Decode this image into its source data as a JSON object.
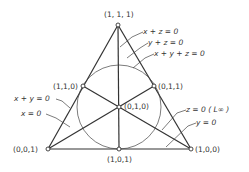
{
  "figure": {
    "points": [
      {
        "id": "top",
        "label": "(1, 1, 1)"
      },
      {
        "id": "left-mid",
        "label": "(1,1,0)"
      },
      {
        "id": "right-mid",
        "label": "(0,1,1)"
      },
      {
        "id": "center",
        "label": "(0,1,0)"
      },
      {
        "id": "bottom-left",
        "label": "(0,0,1)"
      },
      {
        "id": "bottom-mid",
        "label": "(1,0,1)"
      },
      {
        "id": "bottom-right",
        "label": "(1,0,0)"
      }
    ],
    "lines": [
      {
        "id": "x-plus-z",
        "label": "x + z = 0"
      },
      {
        "id": "y-plus-z",
        "label": "y + z = 0"
      },
      {
        "id": "x-plus-y-plus-z",
        "label": "x + y + z = 0"
      },
      {
        "id": "x-plus-y",
        "label": "x + y = 0"
      },
      {
        "id": "x-zero",
        "label": "x = 0"
      },
      {
        "id": "z-zero",
        "label": "z = 0 ( L∞ )"
      },
      {
        "id": "y-zero",
        "label": "y = 0"
      }
    ],
    "colors": {
      "stroke": "#333333",
      "background": "#ffffff"
    }
  }
}
